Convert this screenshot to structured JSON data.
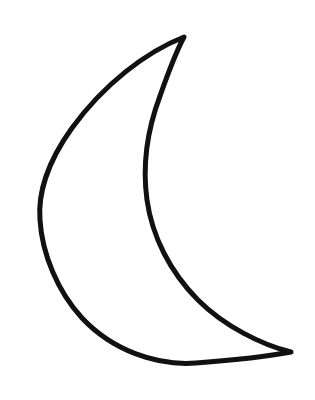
{
  "canvas": {
    "width": 315,
    "height": 400,
    "background_color": "#ffffff"
  },
  "artwork": {
    "name": "crescent-moon",
    "type": "line-drawing",
    "description": "Hand-drawn crescent moon outline",
    "stroke_color": "#111111",
    "fill_color": "#ffffff",
    "stroke_width": 5,
    "stroke_linecap": "round",
    "stroke_linejoin": "round",
    "path": "M 184 37 C 146 52 104 84 72 128 C 46 164 38 196 40 220 C 42 254 58 292 82 318 C 112 350 156 366 196 363 C 236 360 270 356 291 352 C 262 345 224 326 198 300 C 170 272 152 236 147 200 C 142 164 148 128 160 96 C 167 76 175 54 184 37 Z",
    "cusps": {
      "top": {
        "x": 184,
        "y": 37
      },
      "bottom": {
        "x": 291,
        "y": 352
      }
    },
    "extents": {
      "leftmost_x": 40,
      "rightmost_x": 291,
      "topmost_y": 37,
      "bottommost_y": 365
    }
  }
}
